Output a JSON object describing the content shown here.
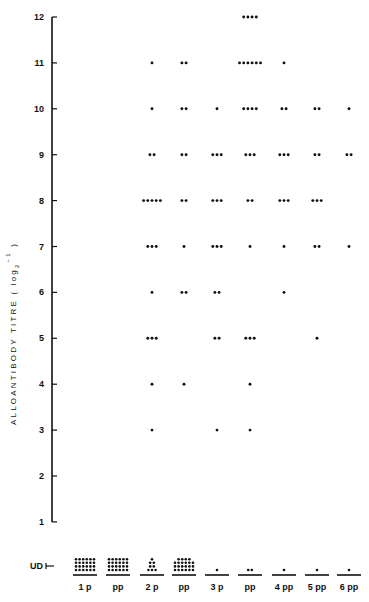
{
  "chart_data": {
    "type": "scatter",
    "title": "",
    "xlabel": "",
    "ylabel": "ALLOANTIBODY TITRE (log2 -1)",
    "ylabel_parts": {
      "main": "ALLOANTIBODY  TITRE  ( log",
      "sub": "2",
      "sup": "−1",
      "close": ")"
    },
    "yticks": [
      1,
      2,
      3,
      4,
      5,
      6,
      7,
      8,
      9,
      10,
      11,
      12
    ],
    "ylim": [
      1,
      12
    ],
    "ud_label": "UD",
    "grid": false,
    "legend": null,
    "categories": [
      "1 p",
      "pp",
      "2 p",
      "pp",
      "3 p",
      "pp",
      "4 pp",
      "5 pp",
      "6 pp"
    ],
    "counts_by_titre": {
      "UD": [
        24,
        24,
        8,
        22,
        1,
        2,
        1,
        1,
        1
      ],
      "3": [
        0,
        0,
        1,
        0,
        1,
        1,
        0,
        0,
        0
      ],
      "4": [
        0,
        0,
        1,
        1,
        0,
        1,
        0,
        0,
        0
      ],
      "5": [
        0,
        0,
        3,
        0,
        2,
        3,
        0,
        1,
        0
      ],
      "6": [
        0,
        0,
        1,
        2,
        2,
        0,
        1,
        0,
        0
      ],
      "7": [
        0,
        0,
        3,
        1,
        3,
        1,
        1,
        2,
        1
      ],
      "8": [
        0,
        0,
        5,
        2,
        3,
        2,
        3,
        3,
        0
      ],
      "9": [
        0,
        0,
        2,
        2,
        3,
        3,
        3,
        2,
        2
      ],
      "10": [
        0,
        0,
        1,
        2,
        1,
        4,
        2,
        2,
        1
      ],
      "11": [
        0,
        0,
        1,
        2,
        0,
        6,
        1,
        0,
        0
      ],
      "12": [
        0,
        0,
        0,
        0,
        0,
        4,
        0,
        0,
        0
      ]
    },
    "ud_layout": [
      {
        "rows": [
          6,
          6,
          6,
          6
        ]
      },
      {
        "rows": [
          6,
          6,
          6,
          6
        ]
      },
      {
        "rows": [
          1,
          2,
          2,
          3
        ]
      },
      {
        "rows": [
          4,
          6,
          6,
          6
        ]
      },
      {
        "rows": [
          1
        ]
      },
      {
        "rows": [
          2
        ]
      },
      {
        "rows": [
          1
        ]
      },
      {
        "rows": [
          1
        ]
      },
      {
        "rows": [
          1
        ]
      }
    ]
  }
}
